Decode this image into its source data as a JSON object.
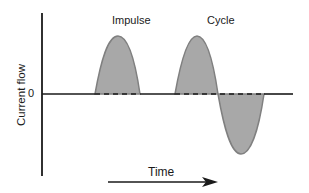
{
  "diagram": {
    "labels": {
      "impulse": "Impulse",
      "cycle": "Cycle",
      "zero": "0",
      "y_axis": "Current flow",
      "x_axis": "Time"
    },
    "colors": {
      "line": "#1a1a1a",
      "wave_fill": "#a8a8a8",
      "wave_stroke": "#808080",
      "background": "#ffffff"
    },
    "elements": [
      {
        "id": "impulse",
        "type": "positive-half-wave",
        "label": "Impulse"
      },
      {
        "id": "cycle-positive",
        "type": "positive-half-wave",
        "label": "Cycle"
      },
      {
        "id": "cycle-negative",
        "type": "negative-half-wave",
        "label": "Cycle"
      }
    ],
    "arrow": {
      "direction": "right",
      "meaning": "Time"
    }
  }
}
